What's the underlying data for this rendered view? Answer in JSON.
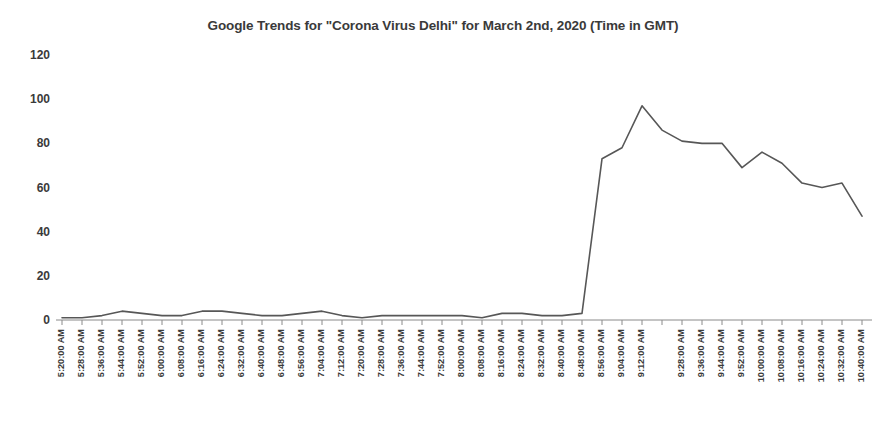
{
  "chart_data": {
    "type": "line",
    "title": "Google Trends for \"Corona Virus Delhi\" for March 2nd, 2020 (Time in GMT)",
    "xlabel": "",
    "ylabel": "",
    "ylim": [
      0,
      120
    ],
    "yticks": [
      0,
      20,
      40,
      60,
      80,
      100,
      120
    ],
    "grid": false,
    "legend": "none",
    "line_color": "#575757",
    "text_color": "#3a3a3a",
    "axis_color": "#8a8a8a",
    "categories": [
      "5:20:00 AM",
      "5:28:00 AM",
      "5:36:00 AM",
      "5:44:00 AM",
      "5:52:00 AM",
      "6:00:00 AM",
      "6:08:00 AM",
      "6:16:00 AM",
      "6:24:00 AM",
      "6:32:00 AM",
      "6:40:00 AM",
      "6:48:00 AM",
      "6:56:00 AM",
      "7:04:00 AM",
      "7:12:00 AM",
      "7:20:00 AM",
      "7:28:00 AM",
      "7:36:00 AM",
      "7:44:00 AM",
      "7:52:00 AM",
      "8:00:00 AM",
      "8:08:00 AM",
      "8:16:00 AM",
      "8:24:00 AM",
      "8:32:00 AM",
      "8:40:00 AM",
      "8:48:00 AM",
      "8:56:00 AM",
      "9:04:00 AM",
      "9:12:00 AM",
      "9:20:00 AM",
      "9:28:00 AM",
      "9:36:00 AM",
      "9:44:00 AM",
      "9:52:00 AM",
      "10:00:00 AM",
      "10:08:00 AM",
      "10:16:00 AM",
      "10:24:00 AM",
      "10:32:00 AM",
      "10:40:00 AM"
    ],
    "tick_labels": [
      "5:20:00 AM",
      "5:28:00 AM",
      "5:36:00 AM",
      "5:44:00 AM",
      "5:52:00 AM",
      "6:00:00 AM",
      "6:08:00 AM",
      "6:16:00 AM",
      "6:24:00 AM",
      "6:32:00 AM",
      "6:40:00 AM",
      "6:48:00 AM",
      "6:56:00 AM",
      "7:04:00 AM",
      "7:12:00 AM",
      "7:20:00 AM",
      "7:28:00 AM",
      "7:36:00 AM",
      "7:44:00 AM",
      "7:52:00 AM",
      "8:00:00 AM",
      "8:08:00 AM",
      "8:16:00 AM",
      "8:24:00 AM",
      "8:32:00 AM",
      "8:40:00 AM",
      "8:48:00 AM",
      "8:56:00 AM",
      "9:04:00 AM",
      "9:12:00 AM",
      "",
      "9:28:00 AM",
      "9:36:00 AM",
      "9:44:00 AM",
      "9:52:00 AM",
      "10:00:00 AM",
      "10:08:00 AM",
      "10:16:00 AM",
      "10:24:00 AM",
      "10:32:00 AM",
      "10:40:00 AM"
    ],
    "values": [
      1,
      1,
      2,
      4,
      3,
      2,
      2,
      4,
      4,
      3,
      2,
      2,
      3,
      4,
      2,
      1,
      2,
      2,
      2,
      2,
      2,
      1,
      3,
      3,
      2,
      2,
      3,
      73,
      78,
      97,
      86,
      81,
      80,
      80,
      69,
      76,
      71,
      62,
      60,
      62,
      47
    ]
  }
}
